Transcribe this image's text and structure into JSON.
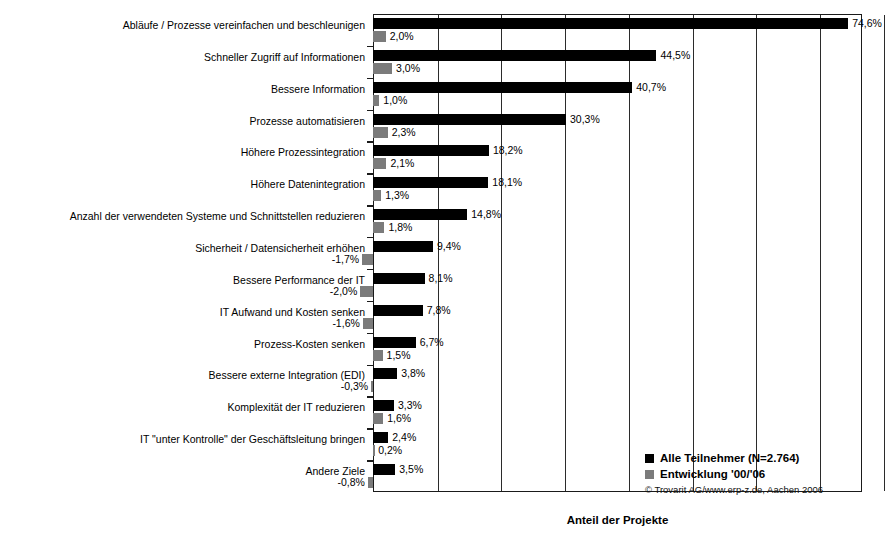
{
  "chart_data": {
    "type": "bar",
    "orientation": "horizontal",
    "title": "",
    "xlabel": "Anteil der Projekte",
    "ylabel": "",
    "grid": true,
    "gridlines_percent": [
      10,
      20,
      30,
      40,
      50,
      60,
      70,
      80
    ],
    "xlim": [
      -5,
      85
    ],
    "legend_position": "bottom-right",
    "value_suffix": "%",
    "decimal_separator": ",",
    "categories": [
      "Abläufe / Prozesse vereinfachen und beschleunigen",
      "Schneller Zugriff auf Informationen",
      "Bessere Information",
      "Prozesse automatisieren",
      "Höhere Prozessintegration",
      "Höhere Datenintegration",
      "Anzahl der verwendeten Systeme und Schnittstellen reduzieren",
      "Sicherheit / Datensicherheit erhöhen",
      "Bessere Performance der IT",
      "IT Aufwand und Kosten senken",
      "Prozess-Kosten senken",
      "Bessere externe Integration (EDI)",
      "Komplexität der IT reduzieren",
      "IT \"unter Kontrolle\" der Geschäftsleitung bringen",
      "Andere Ziele"
    ],
    "series": [
      {
        "name": "Alle Teilnehmer (N=2.764)",
        "color": "#000000",
        "values": [
          74.6,
          44.5,
          40.7,
          30.3,
          18.2,
          18.1,
          14.8,
          9.4,
          8.1,
          7.8,
          6.7,
          3.8,
          3.3,
          2.4,
          3.5
        ],
        "labels": [
          "74,6%",
          "44,5%",
          "40,7%",
          "30,3%",
          "18,2%",
          "18,1%",
          "14,8%",
          "9,4%",
          "8,1%",
          "7,8%",
          "6,7%",
          "3,8%",
          "3,3%",
          "2,4%",
          "3,5%"
        ]
      },
      {
        "name": "Entwicklung '00/'06",
        "color": "#7b7b7b",
        "values": [
          2.0,
          3.0,
          1.0,
          2.3,
          2.1,
          1.3,
          1.8,
          -1.7,
          -2.0,
          -1.6,
          1.5,
          -0.3,
          1.6,
          0.2,
          -0.8
        ],
        "labels": [
          "2,0%",
          "3,0%",
          "1,0%",
          "2,3%",
          "2,1%",
          "1,3%",
          "1,8%",
          "-1,7%",
          "-2,0%",
          "-1,6%",
          "1,5%",
          "-0,3%",
          "1,6%",
          "0,2%",
          "-0,8%"
        ]
      }
    ]
  },
  "legend": {
    "items": [
      {
        "label": "Alle Teilnehmer (N=2.764)",
        "swatch": "black"
      },
      {
        "label": "Entwicklung '00/'06",
        "swatch": "gray"
      }
    ],
    "copyright": "© Trovarit AG/www.erp-z.de, Aachen 2006"
  },
  "axis": {
    "x_title": "Anteil der Projekte"
  }
}
